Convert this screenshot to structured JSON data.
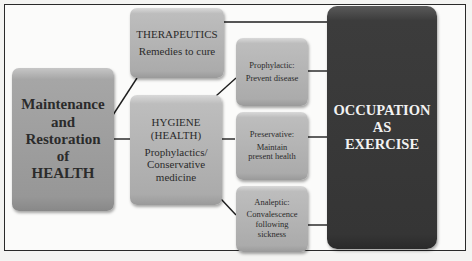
{
  "diagram": {
    "root": {
      "lines": [
        "Maintenance",
        "and",
        "Restoration",
        "of",
        "HEALTH"
      ]
    },
    "therapeutics": {
      "title": "THERAPEUTICS",
      "subtitle": "Remedies to cure"
    },
    "hygiene": {
      "title_lines": [
        "HYGIENE",
        "(HEALTH)"
      ],
      "subtitle_lines": [
        "Prophylactics/",
        "Conservative",
        "medicine"
      ]
    },
    "prophylactic": {
      "lines": [
        "Prophylactic:",
        "Prevent disease"
      ]
    },
    "preservative": {
      "lines": [
        "Preservative:",
        "Maintain",
        "present health"
      ]
    },
    "analeptic": {
      "lines": [
        "Analeptic:",
        "Convalescence",
        "following",
        "sickness"
      ]
    },
    "occupation": {
      "lines": [
        "OCCUPATION",
        "AS",
        "EXERCISE"
      ]
    }
  },
  "colors": {
    "light_box": "#b0b0b0",
    "root_box": "#a0a0a0",
    "dark_box": "#3a3a3a",
    "line": "#1e1e1e"
  }
}
